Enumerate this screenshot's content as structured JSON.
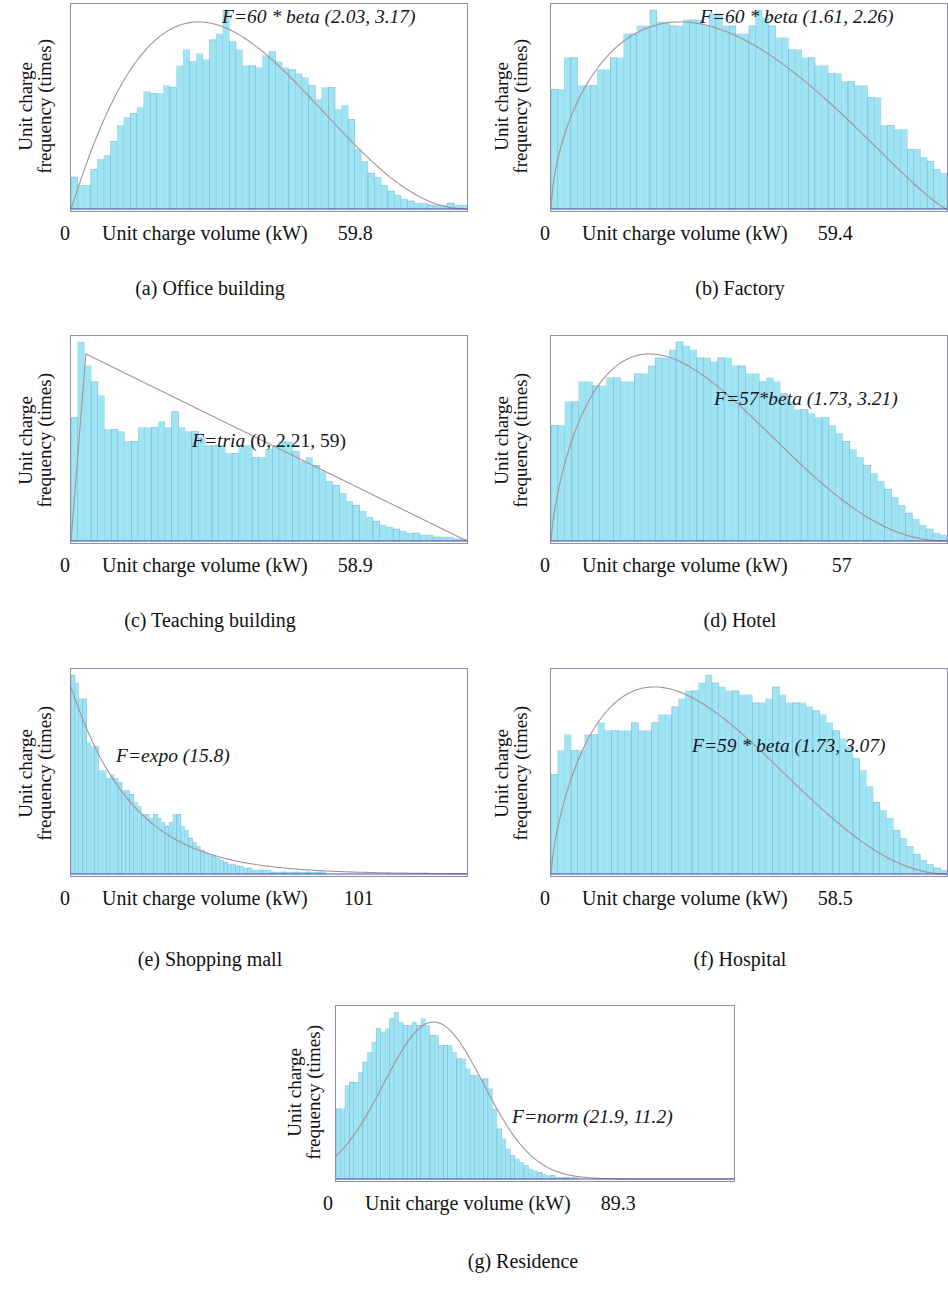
{
  "figure": {
    "axis_x_title": "Unit charge volume (kW)",
    "axis_y_title_line1": "Unit charge",
    "axis_y_title_line2": "frequency (times)",
    "bar_fill_color": "#9fe4f3",
    "bar_edge_color": "#4f8fd0",
    "curve_color": "#a89096",
    "frame_color": "#8d8fa8",
    "baseline_color": "#4a4ab0"
  },
  "panels": [
    {
      "id": "a",
      "caption": "(a) Office building",
      "formula": "F=60 * beta (2.03, 3.17)",
      "x_min_label": "0",
      "x_max_label": "59.8",
      "chart_data": {
        "type": "bar",
        "title": "(a) Office building",
        "xlabel": "Unit charge volume (kW)",
        "ylabel": "Unit charge frequency (times)",
        "distribution": "60 * beta(2.03, 3.17)",
        "xlim": [
          0,
          59.8
        ],
        "grid": false,
        "legend": "none",
        "values": [
          16,
          12,
          12,
          20,
          25,
          27,
          34,
          42,
          46,
          48,
          51,
          59,
          58,
          58,
          62,
          61,
          72,
          80,
          74,
          78,
          75,
          85,
          88,
          100,
          84,
          80,
          72,
          72,
          71,
          77,
          79,
          74,
          71,
          70,
          68,
          66,
          62,
          55,
          61,
          61,
          50,
          52,
          45,
          30,
          24,
          18,
          16,
          12,
          9,
          7,
          5,
          4,
          3,
          3,
          2,
          2,
          2,
          3,
          2,
          2
        ]
      }
    },
    {
      "id": "b",
      "caption": "(b) Factory",
      "formula": "F=60 * beta (1.61, 2.26)",
      "x_min_label": "0",
      "x_max_label": "59.4",
      "chart_data": {
        "type": "bar",
        "title": "(b) Factory",
        "xlabel": "Unit charge volume (kW)",
        "ylabel": "Unit charge frequency (times)",
        "distribution": "60 * beta(1.61, 2.26)",
        "xlim": [
          0,
          59.4
        ],
        "grid": false,
        "legend": "none",
        "values": [
          60,
          60,
          76,
          76,
          62,
          62,
          62,
          70,
          70,
          76,
          76,
          88,
          88,
          92,
          92,
          100,
          94,
          94,
          92,
          92,
          95,
          95,
          95,
          92,
          98,
          98,
          92,
          92,
          88,
          88,
          92,
          100,
          96,
          92,
          86,
          86,
          80,
          80,
          76,
          76,
          72,
          72,
          68,
          68,
          64,
          64,
          62,
          62,
          56,
          56,
          42,
          42,
          40,
          40,
          30,
          30,
          26,
          24,
          20,
          18
        ]
      }
    },
    {
      "id": "c",
      "caption": "(c) Teaching building",
      "formula_italic": "F=tria",
      "formula_roman": " (0, 2.21, 59)",
      "formula": "F=tria (0, 2.21, 59)",
      "x_min_label": "0",
      "x_max_label": "58.9",
      "chart_data": {
        "type": "bar",
        "title": "(c) Teaching building",
        "xlabel": "Unit charge volume (kW)",
        "ylabel": "Unit charge frequency (times)",
        "distribution": "tria(0, 2.21, 59)",
        "xlim": [
          0,
          58.9
        ],
        "grid": false,
        "legend": "none",
        "values": [
          62,
          100,
          88,
          80,
          73,
          56,
          56,
          55,
          50,
          50,
          57,
          57,
          57,
          60,
          57,
          65,
          57,
          55,
          55,
          52,
          48,
          48,
          48,
          44,
          44,
          48,
          48,
          42,
          42,
          46,
          48,
          50,
          50,
          45,
          40,
          42,
          38,
          35,
          30,
          28,
          24,
          20,
          18,
          15,
          12,
          10,
          8,
          7,
          6,
          5,
          4,
          4,
          3,
          3,
          2,
          2,
          2,
          1,
          1
        ]
      }
    },
    {
      "id": "d",
      "caption": "(d) Hotel",
      "formula": "F=57*beta (1.73, 3.21)",
      "x_min_label": "0",
      "x_max_label": "57",
      "chart_data": {
        "type": "bar",
        "title": "(d) Hotel",
        "xlabel": "Unit charge volume (kW)",
        "ylabel": "Unit charge frequency (times)",
        "distribution": "57 * beta(1.73, 3.21)",
        "xlim": [
          0,
          57
        ],
        "grid": false,
        "legend": "none",
        "values": [
          58,
          58,
          70,
          70,
          80,
          80,
          78,
          78,
          82,
          82,
          80,
          80,
          84,
          84,
          88,
          92,
          92,
          96,
          100,
          98,
          96,
          92,
          92,
          90,
          92,
          92,
          88,
          88,
          84,
          84,
          80,
          82,
          80,
          74,
          70,
          66,
          66,
          64,
          62,
          62,
          58,
          54,
          50,
          46,
          42,
          38,
          34,
          30,
          26,
          22,
          18,
          14,
          11,
          8,
          6,
          4,
          3
        ]
      }
    },
    {
      "id": "e",
      "caption": "(e) Shopping mall",
      "formula": "F=expo (15.8)",
      "x_min_label": "0",
      "x_max_label": "101",
      "chart_data": {
        "type": "bar",
        "title": "(e) Shopping mall",
        "xlabel": "Unit charge volume (kW)",
        "ylabel": "Unit charge frequency (times)",
        "distribution": "expo(15.8)",
        "xlim": [
          0,
          101
        ],
        "grid": false,
        "legend": "none",
        "values": [
          100,
          96,
          88,
          88,
          66,
          64,
          64,
          52,
          52,
          48,
          50,
          48,
          46,
          42,
          42,
          40,
          36,
          34,
          30,
          30,
          28,
          30,
          28,
          26,
          24,
          26,
          30,
          30,
          24,
          22,
          18,
          16,
          14,
          12,
          11,
          10,
          9,
          8,
          7,
          6,
          5,
          5,
          4,
          4,
          3,
          3,
          2,
          2,
          2,
          2,
          2,
          1,
          1,
          1,
          1,
          1,
          1,
          1,
          1,
          1,
          1,
          1,
          1,
          1,
          1,
          0,
          0,
          0,
          0,
          0,
          0,
          0,
          0,
          0,
          0,
          0,
          0,
          0,
          0,
          0,
          0,
          0,
          0,
          0,
          0,
          0,
          0,
          0,
          0,
          0,
          0,
          0,
          0,
          0,
          0,
          0,
          0,
          0,
          0,
          0,
          0
        ]
      }
    },
    {
      "id": "f",
      "caption": "(f) Hospital",
      "formula": "F=59 * beta (1.73, 3.07)",
      "x_min_label": "0",
      "x_max_label": "58.5",
      "chart_data": {
        "type": "bar",
        "title": "(f) Hospital",
        "xlabel": "Unit charge volume (kW)",
        "ylabel": "Unit charge frequency (times)",
        "distribution": "59 * beta(1.73, 3.07)",
        "xlim": [
          0,
          58.5
        ],
        "grid": false,
        "legend": "none",
        "values": [
          50,
          62,
          70,
          62,
          62,
          70,
          70,
          76,
          72,
          72,
          72,
          72,
          76,
          72,
          72,
          76,
          80,
          80,
          84,
          88,
          92,
          92,
          96,
          100,
          96,
          94,
          92,
          92,
          90,
          90,
          86,
          86,
          88,
          94,
          90,
          86,
          86,
          86,
          84,
          82,
          80,
          76,
          72,
          68,
          64,
          58,
          52,
          44,
          36,
          32,
          28,
          22,
          18,
          14,
          10,
          7,
          5,
          3,
          2
        ]
      }
    },
    {
      "id": "g",
      "caption": "(g) Residence",
      "formula": "F=norm (21.9, 11.2)",
      "x_min_label": "0",
      "x_max_label": "89.3",
      "chart_data": {
        "type": "bar",
        "title": "(g) Residence",
        "xlabel": "Unit charge volume (kW)",
        "ylabel": "Unit charge frequency (times)",
        "distribution": "norm(21.9, 11.2)",
        "xlim": [
          0,
          89.3
        ],
        "grid": false,
        "legend": "none",
        "values": [
          42,
          42,
          56,
          58,
          58,
          64,
          70,
          76,
          82,
          90,
          88,
          90,
          96,
          100,
          94,
          92,
          92,
          94,
          92,
          96,
          92,
          86,
          86,
          80,
          80,
          80,
          76,
          72,
          72,
          66,
          62,
          62,
          60,
          60,
          54,
          42,
          30,
          24,
          18,
          14,
          12,
          10,
          8,
          6,
          5,
          4,
          3,
          2,
          2,
          1,
          1,
          1,
          1,
          1,
          0,
          0,
          0,
          0,
          0,
          0,
          0,
          0,
          0,
          0,
          0,
          0,
          0,
          0,
          0,
          0,
          0,
          0,
          0,
          0,
          0,
          0,
          0,
          0,
          0,
          0,
          0,
          0,
          0,
          0,
          0,
          0,
          0,
          0,
          0
        ]
      }
    }
  ]
}
